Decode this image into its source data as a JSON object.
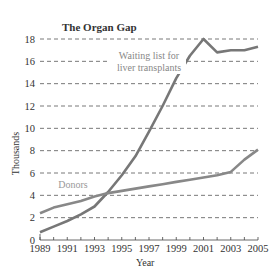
{
  "chart_data": {
    "type": "line",
    "title": "The Organ Gap",
    "xlabel": "Year",
    "ylabel": "Thousands",
    "x": [
      1989,
      1990,
      1991,
      1992,
      1993,
      1994,
      1995,
      1996,
      1997,
      1998,
      1999,
      2000,
      2001,
      2002,
      2003,
      2004,
      2005
    ],
    "x_tick_labels": [
      "1989",
      "1991",
      "1993",
      "1995",
      "1997",
      "1999",
      "2001",
      "2003",
      "2005"
    ],
    "y_tick_labels": [
      "0",
      "2",
      "4",
      "6",
      "8",
      "10",
      "12",
      "14",
      "16",
      "18"
    ],
    "ylim": [
      0,
      18
    ],
    "grid": "horizontal dashed",
    "series": [
      {
        "name": "Waiting list for liver transplants",
        "values": [
          0.7,
          1.2,
          1.7,
          2.3,
          3.0,
          4.3,
          5.8,
          7.5,
          9.7,
          12.0,
          14.5,
          16.5,
          18.0,
          16.8,
          17.0,
          17.0,
          17.3
        ],
        "color": "#777777"
      },
      {
        "name": "Donors",
        "values": [
          2.4,
          2.9,
          3.2,
          3.5,
          3.9,
          4.2,
          4.4,
          4.6,
          4.8,
          5.0,
          5.2,
          5.4,
          5.6,
          5.8,
          6.1,
          7.2,
          8.1
        ],
        "color": "#888888"
      }
    ],
    "annotations": [
      {
        "text_line1": "Waiting list for",
        "text_line2": "liver transplants",
        "series": 0
      },
      {
        "text": "Donors",
        "series": 1
      }
    ]
  }
}
